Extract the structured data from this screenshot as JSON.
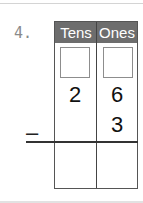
{
  "problem": {
    "number": "4.",
    "headers": {
      "tens": "Tens",
      "ones": "Ones"
    },
    "regroup_boxes": {
      "tens": "",
      "ones": ""
    },
    "minuend": {
      "tens": "2",
      "ones": "6"
    },
    "subtrahend": {
      "tens": "",
      "ones": "3"
    },
    "operator": "–",
    "answer": {
      "tens": "",
      "ones": ""
    }
  },
  "colors": {
    "header_bg": "#6d6d6d",
    "header_text": "#ffffff",
    "number": "#8a8a8a"
  }
}
